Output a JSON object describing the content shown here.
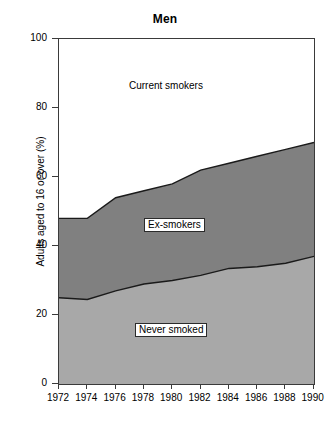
{
  "chart_data": {
    "type": "area",
    "title": "Men",
    "xlabel": "",
    "ylabel": "Adults aged to 16 or over (%)",
    "xlim": [
      1972,
      1990
    ],
    "ylim": [
      0,
      100
    ],
    "grid": false,
    "legend_position": "inside-areas",
    "stacked": true,
    "x": [
      1972,
      1974,
      1976,
      1978,
      1980,
      1982,
      1984,
      1986,
      1988,
      1990
    ],
    "x_tick_labels": [
      "1972",
      "1974",
      "1976",
      "1978",
      "1980",
      "1982",
      "1984",
      "1986",
      "1988",
      "1990"
    ],
    "y_tick_values": [
      0,
      20,
      40,
      60,
      80,
      100
    ],
    "y_tick_labels": [
      "0",
      "20",
      "40",
      "60",
      "80",
      "100"
    ],
    "series": [
      {
        "name": "Never smoked",
        "color": "#a8a8a8",
        "cumulative_top": [
          25,
          24.5,
          27,
          29,
          30,
          31.5,
          33.5,
          34,
          35,
          37
        ],
        "values": [
          25,
          24.5,
          27,
          29,
          30,
          31.5,
          33.5,
          34,
          35,
          37
        ]
      },
      {
        "name": "Ex-smokers",
        "color": "#808080",
        "cumulative_top": [
          48,
          48,
          54,
          56,
          58,
          62,
          64,
          66,
          68,
          70
        ],
        "values": [
          23,
          23.5,
          27,
          27,
          28,
          30.5,
          30.5,
          32,
          33,
          33
        ]
      },
      {
        "name": "Current smokers",
        "color": "#ffffff",
        "cumulative_top": [
          100,
          100,
          100,
          100,
          100,
          100,
          100,
          100,
          100,
          100
        ],
        "values": [
          52,
          52,
          46,
          44,
          42,
          38,
          36,
          34,
          32,
          30
        ]
      }
    ],
    "annotations": [
      {
        "text": "Current smokers",
        "area": "current-smokers",
        "boxed": false
      },
      {
        "text": "Ex-smokers",
        "area": "ex-smokers",
        "boxed": true
      },
      {
        "text": "Never smoked",
        "area": "never-smoked",
        "boxed": true
      }
    ],
    "colors": {
      "never_smoked": "#a8a8a8",
      "ex_smokers": "#808080",
      "current_smokers": "#ffffff",
      "axis": "#3a3a3a",
      "boundary_line": "#1a1a1a",
      "background": "#ffffff"
    }
  }
}
